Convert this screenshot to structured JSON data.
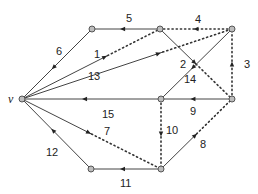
{
  "diagram": {
    "type": "directed-graph",
    "colors": {
      "edge": "#444444",
      "node_fill": "#bdbdbd",
      "node_stroke": "#555555",
      "dotted": "#333333"
    },
    "nodes": [
      {
        "id": "v",
        "label": "v",
        "x": 22,
        "y": 99
      },
      {
        "id": "A",
        "label": "",
        "x": 92,
        "y": 29
      },
      {
        "id": "B",
        "label": "",
        "x": 160,
        "y": 29
      },
      {
        "id": "C",
        "label": "",
        "x": 232,
        "y": 29
      },
      {
        "id": "D",
        "label": "",
        "x": 161,
        "y": 99
      },
      {
        "id": "E",
        "label": "",
        "x": 232,
        "y": 99
      },
      {
        "id": "F",
        "label": "",
        "x": 91,
        "y": 169
      },
      {
        "id": "G",
        "label": "",
        "x": 161,
        "y": 169
      }
    ],
    "edges": [
      {
        "label": "1",
        "from": "v",
        "to": "B",
        "style": "solid-then-dotted",
        "split": 0.62,
        "label_pos": [
          94,
          58
        ]
      },
      {
        "label": "2",
        "from": "B",
        "to": "E",
        "style": "solid-then-dotted",
        "split": 0.5,
        "label_pos": [
          180,
          68
        ]
      },
      {
        "label": "3",
        "from": "E",
        "to": "C",
        "style": "dotted",
        "label_pos": [
          244,
          68
        ]
      },
      {
        "label": "4",
        "from": "C",
        "to": "B",
        "style": "dotted",
        "label_pos": [
          195,
          23
        ]
      },
      {
        "label": "5",
        "from": "B",
        "to": "A",
        "style": "solid",
        "label_pos": [
          126,
          22
        ]
      },
      {
        "label": "6",
        "from": "A",
        "to": "v",
        "style": "solid",
        "label_pos": [
          56,
          55
        ]
      },
      {
        "label": "7",
        "from": "v",
        "to": "G",
        "style": "solid-then-dotted",
        "split": 0.5,
        "label_pos": [
          104,
          135
        ]
      },
      {
        "label": "8",
        "from": "G",
        "to": "E",
        "style": "solid-then-dotted",
        "split": 0.5,
        "label_pos": [
          200,
          148
        ]
      },
      {
        "label": "9",
        "from": "E",
        "to": "D",
        "style": "solid",
        "label_pos": [
          190,
          115
        ]
      },
      {
        "label": "10",
        "from": "D",
        "to": "G",
        "style": "dotted",
        "label_pos": [
          166,
          134
        ]
      },
      {
        "label": "11",
        "from": "G",
        "to": "F",
        "style": "solid",
        "label_pos": [
          120,
          187
        ]
      },
      {
        "label": "12",
        "from": "F",
        "to": "v",
        "style": "solid",
        "label_pos": [
          46,
          156
        ]
      },
      {
        "label": "13",
        "from": "v",
        "to": "C",
        "style": "solid-then-dotted",
        "split": 0.67,
        "label_pos": [
          88,
          80
        ]
      },
      {
        "label": "14",
        "from": "C",
        "to": "D",
        "style": "solid",
        "label_pos": [
          184,
          83
        ]
      },
      {
        "label": "15",
        "from": "D",
        "to": "v",
        "style": "solid",
        "label_pos": [
          102,
          118
        ]
      }
    ]
  }
}
